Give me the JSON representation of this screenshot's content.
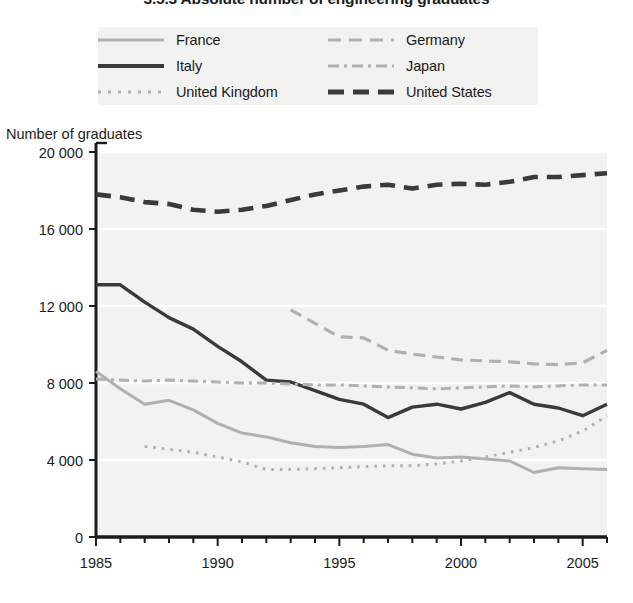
{
  "title": "3.5.3  Absolute number of engineering graduates",
  "legend": {
    "position": "top",
    "items": [
      {
        "label": "France",
        "key": "france",
        "swatch": "solid-light-line"
      },
      {
        "label": "Germany",
        "key": "germany",
        "swatch": "dashed-light-line"
      },
      {
        "label": "Italy",
        "key": "italy",
        "swatch": "solid-dark-line"
      },
      {
        "label": "Japan",
        "key": "japan",
        "swatch": "dash-dot-light-line"
      },
      {
        "label": "United Kingdom",
        "key": "united_kingdom",
        "swatch": "dotted-light-line"
      },
      {
        "label": "United States",
        "key": "united_states",
        "swatch": "dashed-dark-line"
      }
    ]
  },
  "axes": {
    "y_title": "Number of graduates",
    "y_ticks": [
      "0",
      "4 000",
      "8 000",
      "12 000",
      "16 000",
      "20 000"
    ],
    "x_ticks": [
      "1985",
      "1990",
      "1995",
      "2000",
      "2005"
    ]
  },
  "colors": {
    "dark": "#3a3a3a",
    "light": "#b0b0b0",
    "mid": "#9a9a9a",
    "plot_bg": "#f2f2f0",
    "axis": "#1b1b1b",
    "gridline": "#ffffff",
    "text": "#1b1b1b"
  },
  "chart_data": {
    "type": "line",
    "title": "3.5.3  Absolute number of engineering graduates",
    "xlabel": "",
    "ylabel": "Number of graduates",
    "xlim": [
      1985,
      2006
    ],
    "ylim": [
      0,
      20000
    ],
    "ytick_values": [
      0,
      4000,
      8000,
      12000,
      16000,
      20000
    ],
    "xtick_values": [
      1985,
      1990,
      1995,
      2000,
      2005
    ],
    "grid": "horizontal",
    "legend_position": "top",
    "series": [
      {
        "name": "France",
        "color": "#b0b0b0",
        "style": "solid",
        "x": [
          1985,
          1986,
          1987,
          1988,
          1989,
          1990,
          1991,
          1992,
          1993,
          1994,
          1995,
          1996,
          1997,
          1998,
          1999,
          2000,
          2001,
          2002,
          2003,
          2004,
          2005,
          2006
        ],
        "values": [
          8600,
          7700,
          6900,
          7100,
          6600,
          5900,
          5400,
          5200,
          4900,
          4700,
          4650,
          4700,
          4800,
          4300,
          4100,
          4150,
          4050,
          3950,
          3350,
          3600,
          3550,
          3500
        ]
      },
      {
        "name": "Germany",
        "color": "#b0b0b0",
        "style": "dashed",
        "x": [
          1993,
          1994,
          1995,
          1996,
          1997,
          1998,
          1999,
          2000,
          2001,
          2002,
          2003,
          2004,
          2005,
          2006
        ],
        "values": [
          11800,
          11100,
          10400,
          10350,
          9700,
          9500,
          9350,
          9200,
          9150,
          9100,
          9000,
          8950,
          9050,
          9700
        ]
      },
      {
        "name": "Italy",
        "color": "#3a3a3a",
        "style": "solid",
        "x": [
          1985,
          1986,
          1987,
          1988,
          1989,
          1990,
          1991,
          1992,
          1993,
          1994,
          1995,
          1996,
          1997,
          1998,
          1999,
          2000,
          2001,
          2002,
          2003,
          2004,
          2005,
          2006
        ],
        "values": [
          13100,
          13100,
          12200,
          11400,
          10800,
          9900,
          9100,
          8150,
          8050,
          7600,
          7150,
          6900,
          6200,
          6750,
          6900,
          6650,
          7000,
          7500,
          6900,
          6700,
          6300,
          6900
        ]
      },
      {
        "name": "Japan",
        "color": "#b0b0b0",
        "style": "dash-dot",
        "x": [
          1985,
          1986,
          1987,
          1988,
          1989,
          1990,
          1991,
          1992,
          1993,
          1994,
          1995,
          1996,
          1997,
          1998,
          1999,
          2000,
          2001,
          2002,
          2003,
          2004,
          2005,
          2006
        ],
        "values": [
          8200,
          8150,
          8100,
          8150,
          8100,
          8050,
          8000,
          8000,
          7950,
          7900,
          7900,
          7850,
          7800,
          7750,
          7700,
          7750,
          7800,
          7850,
          7800,
          7850,
          7900,
          7900
        ]
      },
      {
        "name": "United Kingdom",
        "color": "#b0b0b0",
        "style": "dotted",
        "x": [
          1987,
          1988,
          1989,
          1990,
          1991,
          1992,
          1993,
          1994,
          1995,
          1996,
          1997,
          1998,
          1999,
          2000,
          2001,
          2002,
          2003,
          2004,
          2005,
          2006
        ],
        "values": [
          4700,
          4550,
          4400,
          4150,
          3900,
          3500,
          3500,
          3550,
          3600,
          3650,
          3700,
          3700,
          3800,
          3950,
          4150,
          4400,
          4650,
          5000,
          5500,
          6300
        ]
      },
      {
        "name": "United States",
        "color": "#3a3a3a",
        "style": "dashed",
        "x": [
          1985,
          1986,
          1987,
          1988,
          1989,
          1990,
          1991,
          1992,
          1993,
          1994,
          1995,
          1996,
          1997,
          1998,
          1999,
          2000,
          2001,
          2002,
          2003,
          2004,
          2005,
          2006
        ],
        "values": [
          17800,
          17650,
          17400,
          17300,
          17000,
          16900,
          17000,
          17200,
          17500,
          17800,
          18000,
          18200,
          18300,
          18100,
          18300,
          18350,
          18300,
          18450,
          18700,
          18700,
          18800,
          18900
        ]
      }
    ]
  }
}
